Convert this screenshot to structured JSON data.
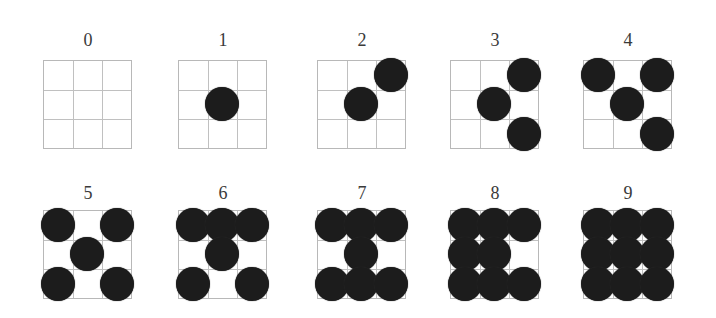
{
  "figure": {
    "colors": {
      "background": "#ffffff",
      "grid_line": "#b8b8b8",
      "dot": "#1c1c1c",
      "label": "#3a3a3a"
    },
    "panels": [
      {
        "label": "0",
        "dots": []
      },
      {
        "label": "1",
        "dots": [
          [
            1,
            1
          ]
        ]
      },
      {
        "label": "2",
        "dots": [
          [
            1,
            1
          ],
          [
            0,
            2
          ]
        ]
      },
      {
        "label": "3",
        "dots": [
          [
            0,
            2
          ],
          [
            1,
            1
          ],
          [
            2,
            2
          ]
        ]
      },
      {
        "label": "4",
        "dots": [
          [
            0,
            0
          ],
          [
            0,
            2
          ],
          [
            1,
            1
          ],
          [
            2,
            2
          ]
        ]
      },
      {
        "label": "5",
        "dots": [
          [
            0,
            0
          ],
          [
            0,
            2
          ],
          [
            1,
            1
          ],
          [
            2,
            0
          ],
          [
            2,
            2
          ]
        ]
      },
      {
        "label": "6",
        "dots": [
          [
            0,
            0
          ],
          [
            0,
            1
          ],
          [
            0,
            2
          ],
          [
            1,
            1
          ],
          [
            2,
            0
          ],
          [
            2,
            2
          ]
        ]
      },
      {
        "label": "7",
        "dots": [
          [
            0,
            0
          ],
          [
            0,
            1
          ],
          [
            0,
            2
          ],
          [
            1,
            1
          ],
          [
            2,
            0
          ],
          [
            2,
            1
          ],
          [
            2,
            2
          ]
        ]
      },
      {
        "label": "8",
        "dots": [
          [
            0,
            0
          ],
          [
            0,
            1
          ],
          [
            0,
            2
          ],
          [
            1,
            0
          ],
          [
            1,
            1
          ],
          [
            2,
            0
          ],
          [
            2,
            1
          ],
          [
            2,
            2
          ]
        ]
      },
      {
        "label": "9",
        "dots": [
          [
            0,
            0
          ],
          [
            0,
            1
          ],
          [
            0,
            2
          ],
          [
            1,
            0
          ],
          [
            1,
            1
          ],
          [
            1,
            2
          ],
          [
            2,
            0
          ],
          [
            2,
            1
          ],
          [
            2,
            2
          ]
        ]
      }
    ]
  }
}
